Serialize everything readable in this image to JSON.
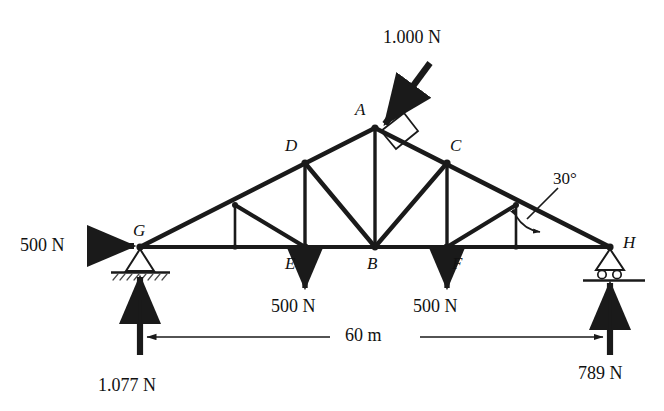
{
  "figure": {
    "background_color": "#ffffff",
    "line_color": "#1a1a1a",
    "span_label": "60 m",
    "angle_label": "30°"
  },
  "nodes": [
    {
      "id": "A",
      "label": "A",
      "x": 375,
      "y": 128,
      "role": "apex-joint"
    },
    {
      "id": "D",
      "label": "D",
      "x": 305,
      "y": 163,
      "role": "upper-chord-joint"
    },
    {
      "id": "C",
      "label": "C",
      "x": 447,
      "y": 163,
      "role": "upper-chord-joint"
    },
    {
      "id": "G",
      "label": "G",
      "x": 140,
      "y": 247,
      "role": "pin-support-joint"
    },
    {
      "id": "E",
      "label": "E",
      "x": 305,
      "y": 247,
      "role": "lower-chord-joint"
    },
    {
      "id": "B",
      "label": "B",
      "x": 375,
      "y": 247,
      "role": "lower-chord-joint"
    },
    {
      "id": "F",
      "label": "F",
      "x": 447,
      "y": 247,
      "role": "lower-chord-joint"
    },
    {
      "id": "H",
      "label": "H",
      "x": 610,
      "y": 247,
      "role": "roller-support-joint"
    }
  ],
  "loads": [
    {
      "id": "load-apex",
      "magnitude": "1.000 N",
      "applied_at": "A",
      "direction": "perpendicular-to-rafter-downward-left"
    },
    {
      "id": "load-left",
      "magnitude": "500 N",
      "applied_at": "G",
      "direction": "horizontal-right"
    },
    {
      "id": "load-e",
      "magnitude": "500 N",
      "applied_at": "E",
      "direction": "vertical-down"
    },
    {
      "id": "load-f",
      "magnitude": "500 N",
      "applied_at": "F",
      "direction": "vertical-down"
    }
  ],
  "reactions": [
    {
      "id": "reaction-left",
      "magnitude": "1.077 N",
      "applied_at": "G",
      "direction": "vertical-up"
    },
    {
      "id": "reaction-right",
      "magnitude": "789 N",
      "applied_at": "H",
      "direction": "vertical-up"
    }
  ],
  "supports": [
    {
      "id": "support-g",
      "type": "pinned",
      "at": "G"
    },
    {
      "id": "support-h",
      "type": "roller",
      "at": "H"
    }
  ],
  "dimension": {
    "id": "span-dimension",
    "label": "60 m",
    "from": "G",
    "to": "H"
  }
}
